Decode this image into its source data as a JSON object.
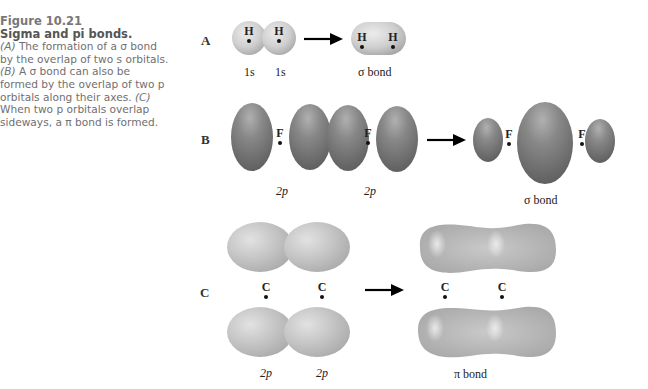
{
  "figure": {
    "number": "Figure 10.21",
    "title": "Sigma and pi bonds.",
    "caption_parts": {
      "a_label": "(A)",
      "a_text": " The formation of a σ bond by the overlap of two s orbitals. ",
      "b_label": "(B)",
      "b_text": " A σ bond can also be formed by the overlap of two p orbitals along their axes. ",
      "c_label": "(C)",
      "c_text": " When two p orbitals overlap sideways, a π bond is formed."
    }
  },
  "panels": {
    "A": {
      "letter": "A",
      "atoms": [
        "H",
        "H",
        "H",
        "H"
      ],
      "labels": [
        "1s",
        "1s",
        "σ bond"
      ]
    },
    "B": {
      "letter": "B",
      "atoms": [
        "F",
        "F",
        "F",
        "F"
      ],
      "labels": [
        "2p",
        "2p",
        "σ bond"
      ]
    },
    "C": {
      "letter": "C",
      "atoms": [
        "C",
        "C",
        "C",
        "C"
      ],
      "labels": [
        "2p",
        "2p",
        "π bond"
      ]
    }
  },
  "colors": {
    "s_orbital": "#c8c8c8",
    "p_orbital_dark": "#7a7a7a",
    "p_orbital_light": "#bdbdbd",
    "arrow": "#000000"
  }
}
